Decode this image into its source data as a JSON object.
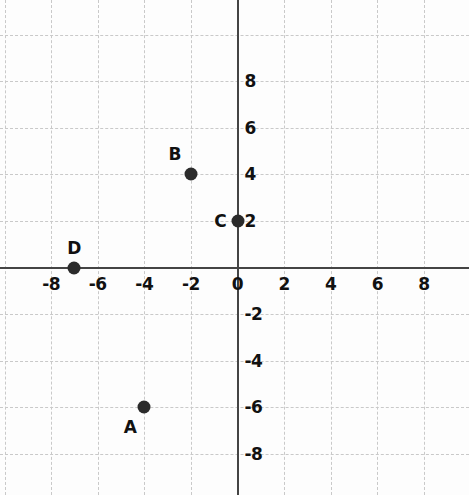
{
  "chart_data": {
    "type": "scatter",
    "title": "",
    "xlabel": "",
    "ylabel": "",
    "xlim": [
      -10,
      10
    ],
    "ylim": [
      -10,
      10
    ],
    "grid": true,
    "grid_step": 2,
    "legend": "none",
    "x_tick_labels": [
      "-8",
      "-6",
      "-4",
      "-2",
      "0",
      "2",
      "4",
      "6",
      "8"
    ],
    "x_tick_values": [
      -8,
      -6,
      -4,
      -2,
      0,
      2,
      4,
      6,
      8
    ],
    "y_tick_labels": [
      "8",
      "6",
      "4",
      "2",
      "-2",
      "-4",
      "-6",
      "-8"
    ],
    "y_tick_values": [
      8,
      6,
      4,
      2,
      -2,
      -4,
      -6,
      -8
    ],
    "points": [
      {
        "label": "A",
        "x": -4,
        "y": -6,
        "label_dx": -14,
        "label_dy": 20
      },
      {
        "label": "B",
        "x": -2,
        "y": 4,
        "label_dx": -16,
        "label_dy": -20
      },
      {
        "label": "C",
        "x": 0,
        "y": 2,
        "label_dx": -17,
        "label_dy": 0
      },
      {
        "label": "D",
        "x": -7,
        "y": 0,
        "label_dx": 0,
        "label_dy": -20
      }
    ],
    "colors": {
      "point": "#2b2b2b",
      "axis": "#444444",
      "grid": "#c9c9c9",
      "label": "#111111",
      "background": "#fdfdfd"
    }
  }
}
